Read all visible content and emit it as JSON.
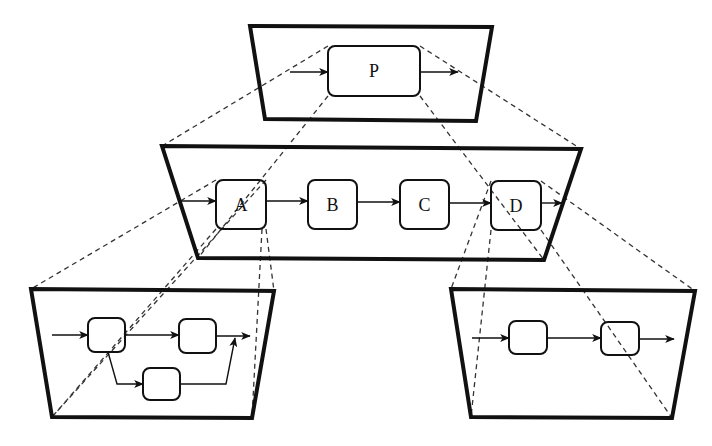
{
  "diagram": {
    "colors": {
      "background": "#ffffff",
      "stroke": "#111111",
      "dashed": "#333333"
    },
    "levels": [
      {
        "id": "level-top",
        "frame": [
          [
            250,
            26
          ],
          [
            492,
            27
          ],
          [
            476,
            121
          ],
          [
            265,
            119
          ]
        ],
        "processes": [
          {
            "id": "P",
            "label": "P",
            "x": 328,
            "y": 46,
            "w": 92,
            "h": 50
          }
        ],
        "arrows": [
          [
            [
              290,
              72
            ],
            [
              328,
              72
            ]
          ],
          [
            [
              420,
              72
            ],
            [
              458,
              72
            ]
          ]
        ]
      },
      {
        "id": "level-middle",
        "frame": [
          [
            162,
            146
          ],
          [
            581,
            149
          ],
          [
            544,
            260
          ],
          [
            198,
            258
          ]
        ],
        "processes": [
          {
            "id": "A",
            "label": "A",
            "x": 216,
            "y": 180,
            "w": 50,
            "h": 49
          },
          {
            "id": "B",
            "label": "B",
            "x": 308,
            "y": 180,
            "w": 49,
            "h": 49
          },
          {
            "id": "C",
            "label": "C",
            "x": 400,
            "y": 180,
            "w": 49,
            "h": 49
          },
          {
            "id": "D",
            "label": "D",
            "x": 491,
            "y": 181,
            "w": 50,
            "h": 49
          }
        ],
        "arrows": [
          [
            [
              180,
              201
            ],
            [
              216,
              201
            ]
          ],
          [
            [
              266,
              201
            ],
            [
              308,
              201
            ]
          ],
          [
            [
              357,
              202
            ],
            [
              400,
              202
            ]
          ],
          [
            [
              449,
              203
            ],
            [
              491,
              203
            ]
          ],
          [
            [
              541,
              203
            ],
            [
              562,
              203
            ]
          ]
        ]
      },
      {
        "id": "level-bottom-left",
        "frame": [
          [
            31,
            289
          ],
          [
            274,
            291
          ],
          [
            252,
            418
          ],
          [
            52,
            417
          ]
        ],
        "processes": [
          {
            "id": "A1",
            "label": "",
            "x": 88,
            "y": 318,
            "w": 37,
            "h": 34
          },
          {
            "id": "A2",
            "label": "",
            "x": 179,
            "y": 319,
            "w": 37,
            "h": 34
          },
          {
            "id": "A3",
            "label": "",
            "x": 143,
            "y": 368,
            "w": 37,
            "h": 32
          }
        ],
        "arrows": [
          [
            [
              52,
              335
            ],
            [
              88,
              335
            ]
          ],
          [
            [
              125,
              335
            ],
            [
              179,
              335
            ]
          ],
          [
            [
              216,
              336
            ],
            [
              250,
              336
            ]
          ],
          [
            [
              108,
              352
            ],
            [
              117,
              384
            ],
            [
              143,
              384
            ]
          ],
          [
            [
              180,
              384
            ],
            [
              226,
              384
            ],
            [
              235,
              338
            ]
          ]
        ]
      },
      {
        "id": "level-bottom-right",
        "frame": [
          [
            451,
            289
          ],
          [
            695,
            291
          ],
          [
            672,
            418
          ],
          [
            471,
            417
          ]
        ],
        "processes": [
          {
            "id": "D1",
            "label": "",
            "x": 509,
            "y": 321,
            "w": 38,
            "h": 33
          },
          {
            "id": "D2",
            "label": "",
            "x": 601,
            "y": 322,
            "w": 38,
            "h": 33
          }
        ],
        "arrows": [
          [
            [
              472,
              338
            ],
            [
              509,
              338
            ]
          ],
          [
            [
              547,
              338
            ],
            [
              601,
              338
            ]
          ],
          [
            [
              639,
              339
            ],
            [
              674,
              339
            ]
          ]
        ]
      }
    ],
    "projection_lines": [
      {
        "from": [
          328,
          46
        ],
        "to": [
          162,
          146
        ]
      },
      {
        "from": [
          420,
          46
        ],
        "to": [
          581,
          149
        ]
      },
      {
        "from": [
          328,
          96
        ],
        "to": [
          198,
          258
        ]
      },
      {
        "from": [
          420,
          96
        ],
        "to": [
          544,
          260
        ]
      },
      {
        "from": [
          216,
          180
        ],
        "to": [
          31,
          289
        ]
      },
      {
        "from": [
          266,
          180
        ],
        "to": [
          52,
          417
        ]
      },
      {
        "from": [
          216,
          229
        ],
        "to": [
          52,
          417
        ]
      },
      {
        "from": [
          266,
          229
        ],
        "to": [
          274,
          291
        ]
      },
      {
        "from": [
          262,
          229
        ],
        "to": [
          252,
          418
        ]
      },
      {
        "from": [
          491,
          181
        ],
        "to": [
          451,
          289
        ]
      },
      {
        "from": [
          541,
          181
        ],
        "to": [
          695,
          291
        ]
      },
      {
        "from": [
          491,
          230
        ],
        "to": [
          471,
          417
        ]
      },
      {
        "from": [
          541,
          230
        ],
        "to": [
          672,
          418
        ]
      }
    ]
  }
}
